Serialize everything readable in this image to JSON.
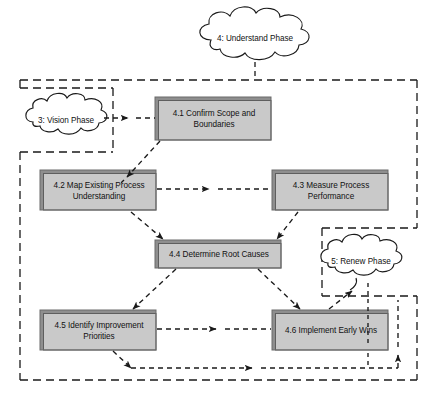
{
  "diagram": {
    "title_cloud": "4: Understand Phase",
    "type": "process-flow-diagram",
    "colors": {
      "box_fill": "#d2d2d2",
      "box_fill_light": "#dcdcdc",
      "box_edge_dark": "#8a8a8a",
      "box_edge_darker": "#6e6e6e",
      "line": "#1a1a1a",
      "background": "#ffffff"
    },
    "clouds": [
      {
        "id": "understand",
        "label": "4: Understand Phase",
        "cx": 255,
        "cy": 38,
        "rx": 62,
        "ry": 25
      },
      {
        "id": "vision",
        "label": "3: Vision Phase",
        "cx": 66,
        "cy": 120,
        "rx": 41,
        "ry": 22
      },
      {
        "id": "renew",
        "label": "5: Renew Phase",
        "cx": 361,
        "cy": 261,
        "rx": 42,
        "ry": 22
      }
    ],
    "boxes": [
      {
        "id": "box-41",
        "label": "4.1 Confirm Scope and Boundaries",
        "line1": "4.1 Confirm Scope and",
        "line2": "Boundaries",
        "x": 155,
        "y": 97,
        "w": 116,
        "h": 43
      },
      {
        "id": "box-42",
        "label": "4.2 Map Existing Process Understanding",
        "line1": "4.2 Map Existing Process",
        "line2": "Understanding",
        "x": 40,
        "y": 170,
        "w": 116,
        "h": 40
      },
      {
        "id": "box-43",
        "label": "4.3 Measure Process Performance",
        "line1": "4.3 Measure Process",
        "line2": "Performance",
        "x": 272,
        "y": 170,
        "w": 116,
        "h": 40
      },
      {
        "id": "box-44",
        "label": "4.4 Determine Root Causes",
        "line1": "4.4 Determine Root Causes",
        "line2": "",
        "x": 155,
        "y": 240,
        "w": 126,
        "h": 28
      },
      {
        "id": "box-45",
        "label": "4.5 Identify Improvement Priorities",
        "line1": "4.5 Identify Improvement",
        "line2": "Priorities",
        "x": 40,
        "y": 310,
        "w": 116,
        "h": 40
      },
      {
        "id": "box-46",
        "label": "4.6 Implement Early Wins",
        "line1": "4.6 Implement Early Wins",
        "line2": "",
        "x": 272,
        "y": 310,
        "w": 116,
        "h": 40
      }
    ],
    "containers": [
      {
        "id": "understand-phase-boundary",
        "x": 20,
        "y": 80,
        "w": 397,
        "h": 300
      },
      {
        "id": "vision-phase-boundary",
        "x": 20,
        "y": 88,
        "w": 93,
        "h": 64
      },
      {
        "id": "renew-phase-boundary",
        "x": 322,
        "y": 228,
        "w": 95,
        "h": 68
      }
    ],
    "connections": [
      {
        "from": "vision",
        "to": "box-41",
        "style": "dashed-arrow"
      },
      {
        "from": "understand",
        "to": "understand-phase-boundary",
        "style": "dashed"
      },
      {
        "from": "box-41",
        "to": "box-42",
        "style": "dashed-arrow"
      },
      {
        "from": "box-42",
        "to": "box-43",
        "style": "dashed-arrow"
      },
      {
        "from": "box-42",
        "to": "box-44",
        "style": "dashed-arrow"
      },
      {
        "from": "box-43",
        "to": "box-44",
        "style": "dashed-arrow"
      },
      {
        "from": "box-44",
        "to": "box-45",
        "style": "dashed-arrow"
      },
      {
        "from": "box-44",
        "to": "box-46",
        "style": "dashed-arrow"
      },
      {
        "from": "box-45",
        "to": "box-46",
        "style": "dashed-arrow"
      },
      {
        "from": "box-46",
        "to": "renew",
        "style": "dashed-arrow"
      },
      {
        "from": "box-45",
        "to": "feedback-loop",
        "style": "dashed-arrow"
      }
    ]
  }
}
